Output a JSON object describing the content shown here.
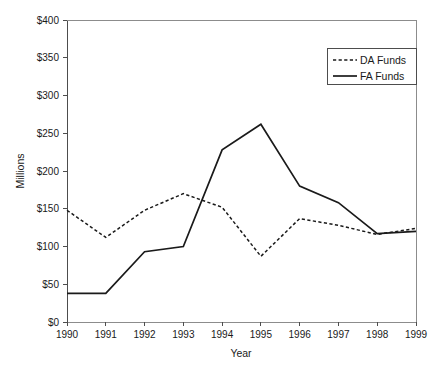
{
  "chart_data": {
    "type": "line",
    "title": "",
    "xlabel": "Year",
    "ylabel": "Millions",
    "x": [
      1990,
      1991,
      1992,
      1993,
      1994,
      1995,
      1996,
      1997,
      1998,
      1999
    ],
    "categories": [
      "1990",
      "1991",
      "1992",
      "1993",
      "1994",
      "1995",
      "1996",
      "1997",
      "1998",
      "1999"
    ],
    "series": [
      {
        "name": "DA Funds",
        "style": "dashed",
        "color": "#1a1a1a",
        "values": [
          148,
          112,
          148,
          170,
          152,
          87,
          137,
          128,
          116,
          124
        ]
      },
      {
        "name": "FA Funds",
        "style": "solid",
        "color": "#1a1a1a",
        "values": [
          38,
          38,
          93,
          100,
          228,
          262,
          180,
          158,
          117,
          120
        ]
      }
    ],
    "xlim": [
      1990,
      1999
    ],
    "ylim": [
      0,
      400
    ],
    "ytick_values": [
      0,
      50,
      100,
      150,
      200,
      250,
      300,
      350,
      400
    ],
    "ytick_labels": [
      "$0",
      "$50",
      "$100",
      "$150",
      "$200",
      "$250",
      "$300",
      "$350",
      "$400"
    ],
    "xtick_labels": [
      "1990",
      "1991",
      "1992",
      "1993",
      "1994",
      "1995",
      "1996",
      "1997",
      "1998",
      "1999"
    ],
    "grid": false,
    "legend_position": "top-right",
    "legend_entries": [
      "DA Funds",
      "FA Funds"
    ]
  }
}
